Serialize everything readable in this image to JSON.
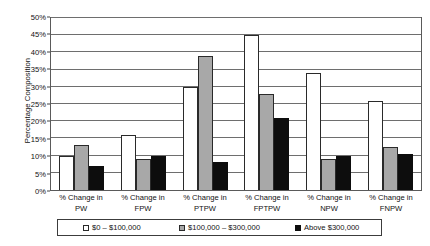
{
  "chart_data": {
    "type": "bar",
    "title": "",
    "xlabel": "",
    "ylabel": "Percentage Composition",
    "ylim": [
      0,
      50
    ],
    "ytick_step": 5,
    "grid": true,
    "legend_position": "bottom",
    "categories": [
      "% Change in PW",
      "% Change in FPW",
      "% Change in PTPW",
      "% Change in FPTPW",
      "% Change in NPW",
      "% Change in FNPW"
    ],
    "category_lines": [
      {
        "line1": "% Change in",
        "line2": "PW"
      },
      {
        "line1": "% Change in",
        "line2": "FPW"
      },
      {
        "line1": "% Change in",
        "line2": "PTPW"
      },
      {
        "line1": "% Change in",
        "line2": "FPTPW"
      },
      {
        "line1": "% Change in",
        "line2": "NPW"
      },
      {
        "line1": "% Change in",
        "line2": "FNPW"
      }
    ],
    "ytick_labels": [
      "0%",
      "5%",
      "10%",
      "15%",
      "20%",
      "25%",
      "30%",
      "35%",
      "40%",
      "45%",
      "50%"
    ],
    "ytick_values": [
      0,
      5,
      10,
      15,
      20,
      25,
      30,
      35,
      40,
      45,
      50
    ],
    "series": [
      {
        "name": "$0 – $100,000",
        "color": "#ffffff",
        "values": [
          10,
          16,
          30,
          45,
          34,
          26
        ]
      },
      {
        "name": "$100,000 – $300,000",
        "color": "#a8a8a8",
        "values": [
          13,
          9,
          39,
          28,
          9,
          12.5
        ]
      },
      {
        "name": "Above $300,000",
        "color": "#0d0d0d",
        "values": [
          7,
          10,
          8,
          21,
          10,
          10.5
        ]
      }
    ]
  },
  "legend": {
    "items": [
      {
        "label": "$0 – $100,000"
      },
      {
        "label": "$100,000 – $300,000"
      },
      {
        "label": "Above $300,000"
      }
    ]
  }
}
